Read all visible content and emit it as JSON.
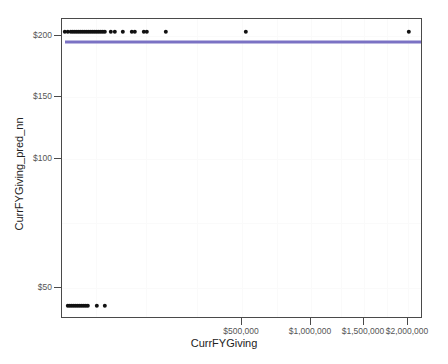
{
  "chart_data": {
    "type": "scatter",
    "title": "",
    "xlabel": "CurrFYGiving",
    "ylabel": "CurrFYGiving_pred_nn",
    "grid": true,
    "legend": null,
    "x_ticks": [
      {
        "label": "$500,000",
        "value": 500000,
        "px": 241
      },
      {
        "label": "$1,000,000",
        "value": 1000000,
        "px": 310
      },
      {
        "label": "$1,500,000",
        "value": 1500000,
        "px": 363
      },
      {
        "label": "$2,000,000",
        "value": 2000000,
        "px": 407
      }
    ],
    "y_ticks": [
      {
        "label": "$200",
        "value": 200,
        "px": 35
      },
      {
        "label": "$150",
        "value": 150,
        "px": 96
      },
      {
        "label": "$100",
        "value": 100,
        "px": 158
      },
      {
        "label": "$50",
        "value": 50,
        "px": 287
      }
    ],
    "ylim": [
      30,
      210
    ],
    "xlim": [
      0,
      2100000
    ],
    "series": [
      {
        "name": "predictions-upper-band",
        "color": "#111111",
        "marker": "circle",
        "y_level": 203,
        "points": [
          {
            "x_px": 64,
            "y_px": 31
          },
          {
            "x_px": 67,
            "y_px": 31
          },
          {
            "x_px": 70,
            "y_px": 31
          },
          {
            "x_px": 72,
            "y_px": 31
          },
          {
            "x_px": 74,
            "y_px": 31
          },
          {
            "x_px": 76,
            "y_px": 31
          },
          {
            "x_px": 78,
            "y_px": 31
          },
          {
            "x_px": 80,
            "y_px": 31
          },
          {
            "x_px": 82,
            "y_px": 31
          },
          {
            "x_px": 84,
            "y_px": 31
          },
          {
            "x_px": 86,
            "y_px": 31
          },
          {
            "x_px": 88,
            "y_px": 31
          },
          {
            "x_px": 90,
            "y_px": 31
          },
          {
            "x_px": 92,
            "y_px": 31
          },
          {
            "x_px": 94,
            "y_px": 31
          },
          {
            "x_px": 96,
            "y_px": 31
          },
          {
            "x_px": 98,
            "y_px": 31
          },
          {
            "x_px": 100,
            "y_px": 31
          },
          {
            "x_px": 102,
            "y_px": 31
          },
          {
            "x_px": 104,
            "y_px": 31
          },
          {
            "x_px": 110,
            "y_px": 31
          },
          {
            "x_px": 114,
            "y_px": 31
          },
          {
            "x_px": 122,
            "y_px": 31
          },
          {
            "x_px": 131,
            "y_px": 31
          },
          {
            "x_px": 134,
            "y_px": 31
          },
          {
            "x_px": 143,
            "y_px": 31
          },
          {
            "x_px": 146,
            "y_px": 31
          },
          {
            "x_px": 165,
            "y_px": 31
          },
          {
            "x_px": 245,
            "y_px": 31
          },
          {
            "x_px": 408,
            "y_px": 31
          }
        ]
      },
      {
        "name": "predictions-lower-band",
        "color": "#111111",
        "marker": "circle",
        "y_level": 41,
        "points": [
          {
            "x_px": 67,
            "y_px": 305
          },
          {
            "x_px": 69,
            "y_px": 305
          },
          {
            "x_px": 71,
            "y_px": 305
          },
          {
            "x_px": 73,
            "y_px": 305
          },
          {
            "x_px": 75,
            "y_px": 305
          },
          {
            "x_px": 77,
            "y_px": 305
          },
          {
            "x_px": 79,
            "y_px": 305
          },
          {
            "x_px": 81,
            "y_px": 305
          },
          {
            "x_px": 83,
            "y_px": 305
          },
          {
            "x_px": 85,
            "y_px": 305
          },
          {
            "x_px": 87,
            "y_px": 305
          },
          {
            "x_px": 96,
            "y_px": 305
          },
          {
            "x_px": 104,
            "y_px": 305
          }
        ]
      }
    ],
    "fit_line": {
      "name": "regression-line",
      "color": "#7b72c4",
      "y_value": 194,
      "y_px": 41,
      "x_start_px": 64,
      "x_end_px": 420
    },
    "gridlines_v_px": [
      95,
      145,
      196,
      241,
      276,
      310,
      340,
      363,
      386,
      407
    ],
    "gridlines_h_px": [
      35,
      96,
      158,
      222,
      287
    ]
  }
}
